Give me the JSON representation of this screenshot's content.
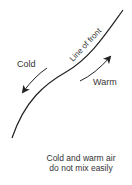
{
  "diagram": {
    "front_label": "Line of front",
    "cold_label": "Cold",
    "warm_label": "Warm",
    "caption_line1": "Cold and warm air",
    "caption_line2": "do not mix easily",
    "line_color": "#222222",
    "text_color": "#333333"
  }
}
